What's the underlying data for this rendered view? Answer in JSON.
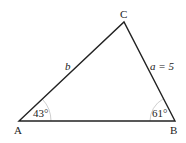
{
  "diagram": {
    "type": "triangle",
    "vertices": {
      "A": {
        "label": "A",
        "x": 19,
        "y": 121
      },
      "B": {
        "label": "B",
        "x": 175,
        "y": 121
      },
      "C": {
        "label": "C",
        "x": 124,
        "y": 22
      }
    },
    "sides": {
      "b": {
        "label": "b"
      },
      "a": {
        "label": "a = 5"
      }
    },
    "angles": {
      "A": {
        "label": "43°"
      },
      "B": {
        "label": "61°"
      }
    },
    "colors": {
      "line": "#222222",
      "arc": "#cccccc"
    }
  }
}
